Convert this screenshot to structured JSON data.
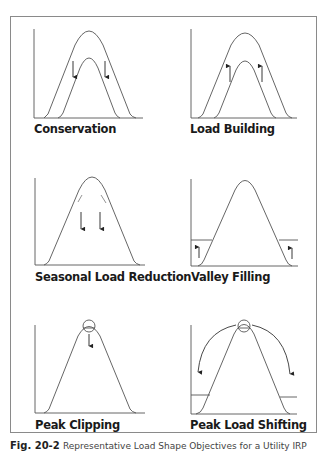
{
  "figure": {
    "panels": [
      {
        "id": "conservation",
        "label": "Conservation",
        "effect": "overall load curve lowered (arrows down)"
      },
      {
        "id": "load-building",
        "label": "Load Building",
        "effect": "overall load curve raised (arrows up)"
      },
      {
        "id": "seasonal-load-reduction",
        "label": "Seasonal Load Reduction",
        "effect": "seasonal load reduced (arrows down)"
      },
      {
        "id": "valley-filling",
        "label": "Valley Filling",
        "effect": "off-peak valleys filled (arrows up at edges)"
      },
      {
        "id": "peak-clipping",
        "label": "Peak Clipping",
        "effect": "peak clipped (circle at peak, arrow down)"
      },
      {
        "id": "peak-load-shifting",
        "label": "Peak Load Shifting",
        "effect": "peak load shifted to off-peak (curved arrows to edges)"
      }
    ],
    "caption": {
      "number": "Fig. 20-2",
      "text": "Representative Load Shape Objectives for a Utility IRP"
    }
  },
  "colors": {
    "line": "#555555",
    "frame": "#8a8a8a",
    "text": "#1a1a1a"
  }
}
